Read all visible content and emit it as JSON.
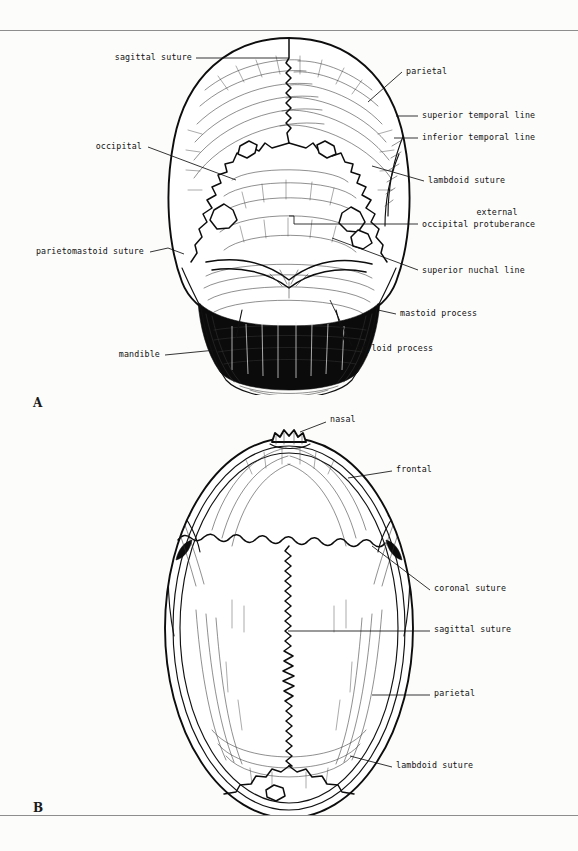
{
  "plate": {
    "panel_a_letter": "A",
    "panel_b_letter": "B"
  },
  "figure_a": {
    "view": "posterior view of skull",
    "labels_left": [
      {
        "id": "sagittal-suture",
        "text": "sagittal suture",
        "x": 108,
        "y": 52,
        "leader": "horizontal right to midline vertex"
      },
      {
        "id": "occipital",
        "text": "occipital",
        "x": 88,
        "y": 143,
        "leader": "diagonal down-right into occipital bone"
      },
      {
        "id": "parietomastoid-suture",
        "text": "parietomastoid suture",
        "x": 26,
        "y": 249,
        "leader": "short up-right hook to mastoid margin"
      },
      {
        "id": "mandible",
        "text": "mandible",
        "x": 108,
        "y": 350,
        "leader": "horizontal right to mandible ramus"
      }
    ],
    "labels_right": [
      {
        "id": "parietal",
        "text": "parietal",
        "x": 406,
        "y": 67,
        "leader": "diagonal down-left onto parietal vault"
      },
      {
        "id": "superior-temporal-line",
        "text": "superior temporal line",
        "x": 420,
        "y": 111,
        "leader": "short horizontal left"
      },
      {
        "id": "inferior-temporal-line",
        "text": "inferior temporal line",
        "x": 420,
        "y": 133,
        "leader": "short horizontal left"
      },
      {
        "id": "lambdoid-suture",
        "text": "lambdoid suture",
        "x": 426,
        "y": 176,
        "leader": "diagonal up-left to lambdoid zigzag"
      },
      {
        "id": "external-occipital-protuberance-line1",
        "text": "external",
        "x": 443,
        "y": 209,
        "leader": "none"
      },
      {
        "id": "external-occipital-protuberance-line2",
        "text": "occipital protuberance",
        "x": 420,
        "y": 221,
        "leader": "horizontal left then step up to midline inion"
      },
      {
        "id": "superior-nuchal-line",
        "text": "superior nuchal line",
        "x": 420,
        "y": 267,
        "leader": "diagonal up-left along nuchal crest"
      },
      {
        "id": "mastoid-process",
        "text": "mastoid process",
        "x": 398,
        "y": 309,
        "leader": "short horizontal left"
      },
      {
        "id": "styloid-process",
        "text": "styloid process",
        "x": 355,
        "y": 344,
        "leader": "diagonal up-left to styloid spike"
      }
    ]
  },
  "figure_b": {
    "view": "superior (vertex) view of skull",
    "labels_right": [
      {
        "id": "nasal",
        "text": "nasal",
        "x": 330,
        "y": 419,
        "leader": "diagonal down-left to nasal bones"
      },
      {
        "id": "frontal",
        "text": "frontal",
        "x": 394,
        "y": 467,
        "leader": "horizontal left onto frontal bone"
      },
      {
        "id": "coronal-suture",
        "text": "coronal suture",
        "x": 432,
        "y": 586,
        "leader": "diagonal up-left to coronal suture"
      },
      {
        "id": "sagittal-suture",
        "text": "sagittal suture",
        "x": 432,
        "y": 627,
        "leader": "horizontal left to midline sagittal suture"
      },
      {
        "id": "parietal",
        "text": "parietal",
        "x": 432,
        "y": 691,
        "leader": "horizontal left onto parietal bone"
      },
      {
        "id": "lambdoid-suture",
        "text": "lambdoid suture",
        "x": 394,
        "y": 763,
        "leader": "diagonal up-left to lambdoid suture"
      }
    ]
  }
}
